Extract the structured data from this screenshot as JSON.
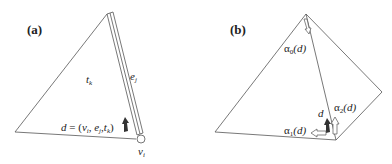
{
  "panels": [
    {
      "id": "a",
      "label": "(a)",
      "face_label": "t",
      "face_sub": "k",
      "edge_label": "e",
      "edge_sub": "j",
      "vertex_label": "v",
      "vertex_sub": "i",
      "dart_eq": {
        "lhs": "d",
        "eq": " = (",
        "v": "v",
        "v_sub": "i",
        "c1": ", ",
        "e": "e",
        "e_sub": "j",
        "c2": ",",
        "t": "t",
        "t_sub": "k",
        "close": ")"
      }
    },
    {
      "id": "b",
      "label": "(b)",
      "dart_label": "d",
      "alpha0": {
        "sym": "α",
        "sub": "0",
        "arg": "(d)"
      },
      "alpha1": {
        "sym": "α",
        "sub": "1",
        "arg": "(d)"
      },
      "alpha2": {
        "sym": "α",
        "sub": "2",
        "arg": "(d)"
      }
    }
  ],
  "colors": {
    "line": "#555555",
    "dart": "#333333",
    "text": "#222222"
  }
}
